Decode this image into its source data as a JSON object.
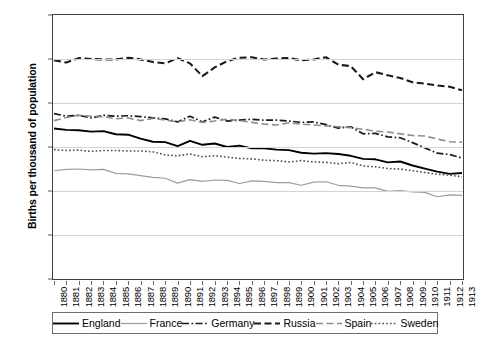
{
  "chart_data": {
    "type": "line",
    "title": "",
    "xlabel": "",
    "ylabel": "Births per thousand of population",
    "ylim": [
      0,
      60
    ],
    "yticks": [
      0,
      10,
      20,
      30,
      40,
      50,
      60
    ],
    "grid": true,
    "legend_position": "bottom",
    "x": [
      1880,
      1881,
      1882,
      1883,
      1884,
      1885,
      1886,
      1887,
      1888,
      1889,
      1890,
      1891,
      1892,
      1893,
      1894,
      1895,
      1896,
      1897,
      1898,
      1899,
      1900,
      1901,
      1902,
      1903,
      1904,
      1905,
      1906,
      1907,
      1908,
      1909,
      1910,
      1911,
      1912,
      1913
    ],
    "categories": [
      "1880",
      "1881",
      "1882",
      "1883",
      "1884",
      "1885",
      "1886",
      "1887",
      "1888",
      "1889",
      "1890",
      "1891",
      "1892",
      "1893",
      "1894",
      "1895",
      "1896",
      "1897",
      "1898",
      "1899",
      "1900",
      "1901",
      "1902",
      "1903",
      "1904",
      "1905",
      "1906",
      "1907",
      "1908",
      "1909",
      "1910",
      "1911",
      "1912",
      "1913"
    ],
    "series": [
      {
        "name": "England",
        "color": "#000000",
        "style": "solid",
        "width": 1.9,
        "values": [
          34.2,
          33.9,
          33.8,
          33.5,
          33.6,
          32.9,
          32.8,
          31.9,
          31.2,
          31.1,
          30.2,
          31.4,
          30.5,
          30.8,
          30.0,
          30.3,
          29.7,
          29.7,
          29.4,
          29.3,
          28.7,
          28.5,
          28.6,
          28.4,
          28.0,
          27.3,
          27.2,
          26.5,
          26.7,
          25.8,
          25.1,
          24.4,
          23.9,
          24.1
        ]
      },
      {
        "name": "France",
        "color": "#9d9d9d",
        "style": "solid",
        "width": 1.2,
        "values": [
          24.6,
          24.9,
          25.0,
          24.8,
          24.9,
          24.0,
          23.9,
          23.5,
          23.1,
          22.9,
          21.8,
          22.6,
          22.2,
          22.5,
          22.4,
          21.7,
          22.3,
          22.2,
          21.9,
          21.9,
          21.3,
          22.0,
          22.1,
          21.3,
          21.1,
          20.7,
          20.7,
          19.9,
          20.1,
          19.8,
          19.7,
          18.7,
          19.1,
          19.0
        ]
      },
      {
        "name": "Germany",
        "color": "#1a1a1a",
        "style": "dashdot",
        "width": 1.7,
        "values": [
          37.6,
          37.0,
          37.2,
          36.6,
          37.2,
          37.0,
          37.1,
          36.9,
          36.6,
          36.4,
          35.7,
          37.0,
          35.7,
          36.8,
          35.9,
          36.1,
          36.3,
          36.1,
          36.1,
          35.9,
          35.6,
          35.7,
          35.1,
          34.3,
          34.6,
          33.0,
          33.1,
          32.3,
          32.1,
          31.0,
          29.8,
          28.6,
          28.3,
          27.5
        ]
      },
      {
        "name": "Russia",
        "color": "#1a1a1a",
        "style": "dash",
        "width": 2.1,
        "values": [
          49.7,
          49.2,
          50.2,
          50.0,
          49.9,
          49.9,
          50.3,
          49.9,
          49.3,
          49.0,
          50.2,
          49.0,
          46.1,
          48.1,
          49.5,
          50.3,
          50.4,
          49.9,
          50.1,
          50.2,
          49.7,
          49.9,
          50.4,
          48.7,
          48.4,
          45.4,
          47.0,
          46.3,
          45.7,
          44.7,
          44.4,
          44.0,
          43.7,
          42.9
        ]
      },
      {
        "name": "Spain",
        "color": "#8c8c8c",
        "style": "dash",
        "width": 1.6,
        "values": [
          36.0,
          36.7,
          37.2,
          37.0,
          36.9,
          36.4,
          36.6,
          36.0,
          36.5,
          36.1,
          35.7,
          36.2,
          35.6,
          35.9,
          36.3,
          36.0,
          35.6,
          35.2,
          35.0,
          35.5,
          35.2,
          35.0,
          34.8,
          34.6,
          34.4,
          34.0,
          33.6,
          33.4,
          33.0,
          32.6,
          32.5,
          31.8,
          31.2,
          31.1
        ]
      },
      {
        "name": "Sweden",
        "color": "#4d4d4d",
        "style": "dot",
        "width": 1.6,
        "values": [
          29.4,
          29.2,
          29.3,
          29.0,
          29.2,
          29.2,
          29.1,
          29.1,
          28.9,
          28.2,
          28.0,
          28.4,
          27.8,
          28.0,
          27.7,
          27.4,
          27.3,
          27.0,
          26.9,
          26.6,
          26.9,
          26.6,
          26.5,
          26.2,
          26.5,
          25.7,
          25.5,
          25.1,
          25.0,
          24.6,
          24.2,
          23.8,
          23.6,
          23.2
        ]
      }
    ]
  },
  "legend": {
    "items": [
      {
        "label": "England"
      },
      {
        "label": "France"
      },
      {
        "label": "Germany"
      },
      {
        "label": "Russia"
      },
      {
        "label": "Spain"
      },
      {
        "label": "Sweden"
      }
    ]
  }
}
